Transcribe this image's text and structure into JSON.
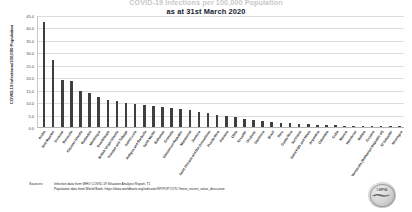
{
  "chart_data": {
    "type": "bar",
    "title": "COVID-19 Infections per 100,000 Population",
    "subtitle": "as at 31st March 2020",
    "xlabel": "",
    "ylabel": "COVID-19 Infections/100,000 Population",
    "ylim": [
      0.0,
      45.0
    ],
    "yticks": [
      "0.0",
      "5.0",
      "10.0",
      "15.0",
      "20.0",
      "25.0",
      "30.0",
      "35.0",
      "40.0",
      "45.0"
    ],
    "grid": true,
    "legend": "none",
    "bar_color": "#3f3f3f",
    "categories": [
      "Aruba",
      "Sint Maarten",
      "Curacao",
      "Bermuda",
      "Cayman Islands",
      "Barbados",
      "Martinique",
      "Guadeloupe",
      "British Virgin Islands",
      "Trinidad and Tobago",
      "Saint Lucia",
      "Antigua and Barbuda",
      "Saint Martin",
      "Bahamas",
      "Grenada",
      "Dominican Republic",
      "Montserrat",
      "Jamaica",
      "Saint Vincent and the Grenadines",
      "Puerto Rico",
      "Panama",
      "Chile",
      "Ecuador",
      "Uruguay",
      "Dominica",
      "Brazil",
      "Peru",
      "Costa Rica",
      "Suriname",
      "Saint Kitts and Nevis",
      "Argentina",
      "Colombia",
      "Cuba",
      "Mexico",
      "Honduras",
      "Bolivia",
      "Guyana",
      "Venezuela (Bolivarian Republic of)",
      "El Salvador",
      "Nicaragua"
    ],
    "values": [
      42.0,
      27.0,
      19.0,
      18.5,
      14.5,
      13.5,
      12.2,
      11.0,
      10.5,
      9.8,
      9.2,
      8.8,
      8.4,
      8.0,
      7.6,
      7.2,
      6.8,
      6.2,
      5.6,
      5.0,
      4.4,
      3.9,
      3.4,
      2.9,
      2.5,
      2.1,
      1.8,
      1.5,
      1.3,
      1.1,
      0.9,
      0.8,
      0.7,
      0.6,
      0.5,
      0.4,
      0.35,
      0.3,
      0.25,
      0.2
    ]
  },
  "sources": {
    "label": "Sources:",
    "lines": [
      "Infection data from WHO COVID-19 Situation Analysis Report, 71",
      "Population data from World Bank: https://data.worldbank.org/indicator/SP.POP.TOTL?most_recent_value_desc=true"
    ]
  },
  "logo": {
    "caption": "CARPHA",
    "icon": "bird-globe-seal-icon"
  }
}
